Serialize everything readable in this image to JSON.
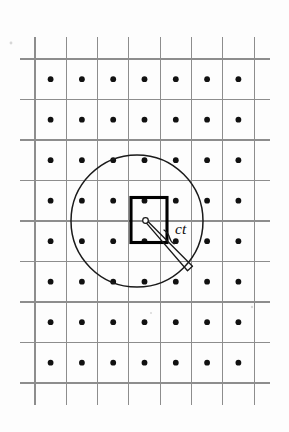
{
  "figure": {
    "kind": "scientific-line-diagram",
    "background_color": "#fdfdfd",
    "labels": {
      "radius": "ct"
    },
    "colors": {
      "grid_line": "#8d8d8d",
      "lattice_dot": "#111111",
      "circle_stroke": "#1a1a1a",
      "unit_cell_stroke": "#000000",
      "origin_fill": "#ffffff",
      "label_text": "#0d0d0d"
    }
  },
  "grid": {
    "vertical_line_x": [
      35,
      66.3,
      97.6,
      128.9,
      160.2,
      191.5,
      222.8,
      254.1
    ],
    "horizontal_line_y": [
      59,
      99.5,
      140,
      180.5,
      221,
      261.5,
      302,
      342.5,
      383
    ],
    "vertical_line_top": 37,
    "vertical_line_bottom": 405,
    "horizontal_line_left": 20,
    "horizontal_line_right": 270,
    "stroke_width": 1.15
  },
  "lattice": {
    "dot_radius": 2.9,
    "columns_x": [
      50.6,
      81.9,
      113.2,
      144.5,
      175.8,
      207.1,
      238.4
    ],
    "rows_y": [
      79.2,
      119.7,
      160.2,
      200.7,
      241.2,
      281.7,
      322.2,
      362.7
    ],
    "visible_rows_y": [
      79.2,
      119.7,
      160.2,
      200.7,
      241.2,
      281.7,
      322.2,
      362.7
    ],
    "dot_count": 49
  },
  "wavefront": {
    "center_x": 137,
    "center_y": 221,
    "radius": 66,
    "stroke_width": 1.5
  },
  "unit_cell": {
    "x": 131,
    "y": 197.5,
    "width": 36,
    "height": 45,
    "stroke_width": 3.1
  },
  "origin_marker": {
    "cx": 145.5,
    "cy": 220.5,
    "r": 2.8
  },
  "radius_indicator": {
    "from_x": 145.5,
    "from_y": 220.5,
    "to_x": 190.0,
    "to_y": 268.5,
    "wedge_half_width": 3.4,
    "brace_x": 171,
    "brace_y": 239,
    "label_x": 175,
    "label_y": 234
  },
  "specks": [
    {
      "x": 11,
      "y": 43,
      "r": 1.4
    },
    {
      "x": 252,
      "y": 307,
      "r": 1.2
    },
    {
      "x": 151,
      "y": 313,
      "r": 1.0
    }
  ]
}
